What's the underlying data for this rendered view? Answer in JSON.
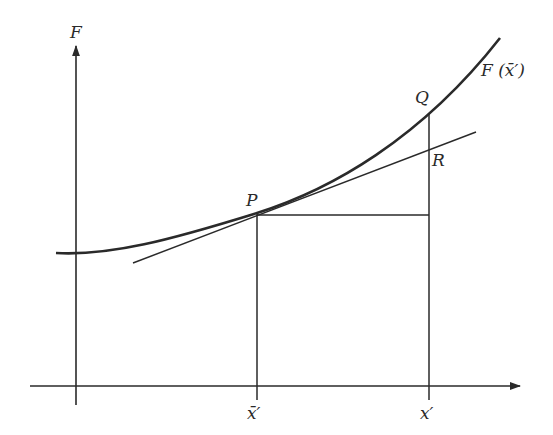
{
  "diagram": {
    "axis_labels": {
      "y_axis": "F",
      "x_tick_left": "x̄′",
      "x_tick_right": "x′"
    },
    "points": {
      "P": "P",
      "Q": "Q",
      "R": "R"
    },
    "curve_label": "F (x̄′)",
    "colors": {
      "ink": "#2a2a2a",
      "background": "#ffffff"
    }
  }
}
